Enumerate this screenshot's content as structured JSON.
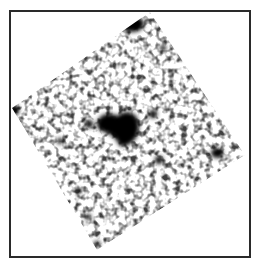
{
  "image": {
    "description": "Grayscale astronomical field, rotated square exposure inside a rectangular frame",
    "colors": {
      "background": "#ffffff",
      "frame": "#2a2a2a",
      "ink": "#000000"
    },
    "field_corners": [
      [
        150,
        12
      ],
      [
        245,
        155
      ],
      [
        97,
        250
      ],
      [
        12,
        108
      ]
    ],
    "sources": [
      {
        "name": "central-source",
        "cx": 120,
        "cy": 128,
        "rx": 22,
        "ry": 15
      },
      {
        "name": "top-dark-patch",
        "cx": 132,
        "cy": 24,
        "rx": 12,
        "ry": 8
      },
      {
        "name": "right-point-source",
        "cx": 217,
        "cy": 153,
        "rx": 6,
        "ry": 5
      },
      {
        "name": "mid-point-source",
        "cx": 159,
        "cy": 160,
        "rx": 4,
        "ry": 4
      },
      {
        "name": "left-edge-patch",
        "cx": 14,
        "cy": 108,
        "rx": 5,
        "ry": 6
      },
      {
        "name": "upper-left-source",
        "cx": 89,
        "cy": 124,
        "rx": 4,
        "ry": 4
      },
      {
        "name": "upper-right-source",
        "cx": 153,
        "cy": 114,
        "rx": 4,
        "ry": 4
      }
    ]
  }
}
